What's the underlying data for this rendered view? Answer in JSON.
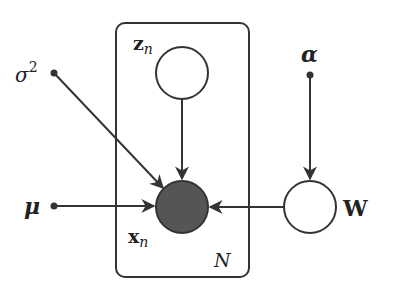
{
  "diagram": {
    "type": "graphical-model-plate",
    "colors": {
      "stroke": "#333333",
      "observed_fill": "#555555",
      "latent_fill": "#ffffff",
      "background": "#ffffff"
    },
    "plate": {
      "label": "N"
    },
    "nodes": {
      "z": {
        "label_main": "z",
        "label_sub": "n",
        "observed": false
      },
      "x": {
        "label_main": "x",
        "label_sub": "n",
        "observed": true
      },
      "W": {
        "label": "W",
        "observed": false
      }
    },
    "parameters": {
      "sigma2": {
        "label_main": "σ",
        "label_sup": "2"
      },
      "mu": {
        "label": "μ"
      },
      "alpha": {
        "label": "α"
      }
    },
    "edges": [
      {
        "from": "sigma2",
        "to": "x"
      },
      {
        "from": "z",
        "to": "x"
      },
      {
        "from": "mu",
        "to": "x"
      },
      {
        "from": "W",
        "to": "x"
      },
      {
        "from": "alpha",
        "to": "W"
      }
    ]
  }
}
